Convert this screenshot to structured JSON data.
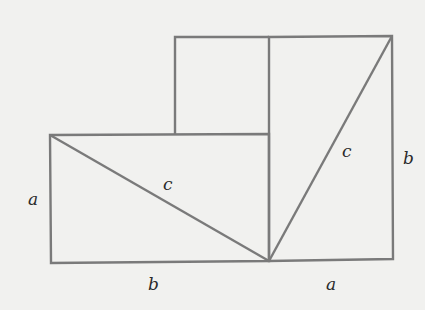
{
  "diagram": {
    "type": "geometric-proof",
    "colors": {
      "background": "#f1f1ef",
      "stroke": "#7a7a7a",
      "label": "#2a2a2a"
    },
    "labels": {
      "left_side": "a",
      "left_hyp": "c",
      "bottom_left": "b",
      "right_hyp": "c",
      "right_side": "b",
      "bottom_right": "a"
    }
  }
}
